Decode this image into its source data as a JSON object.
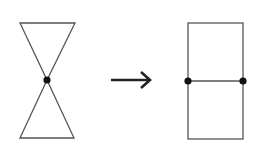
{
  "diagram": {
    "colors": {
      "stroke": "#555555",
      "vertex": "#111111",
      "arrow": "#222222",
      "background": "#ffffff"
    },
    "left_figure": {
      "name": "hourglass",
      "vertices": [
        [
          20,
          23
        ],
        [
          75,
          23
        ],
        [
          47,
          80
        ],
        [
          20,
          138
        ],
        [
          74,
          138
        ]
      ],
      "marked_vertices": [
        [
          47,
          80
        ]
      ]
    },
    "arrow": {
      "from": [
        111,
        80
      ],
      "to": [
        151,
        80
      ],
      "symbol": "→"
    },
    "right_figure": {
      "name": "split-rectangle",
      "rect": {
        "x": 188,
        "y": 23,
        "width": 55,
        "height": 116
      },
      "divider_y": 81,
      "marked_vertices": [
        [
          188,
          81
        ],
        [
          243,
          81
        ]
      ]
    }
  }
}
